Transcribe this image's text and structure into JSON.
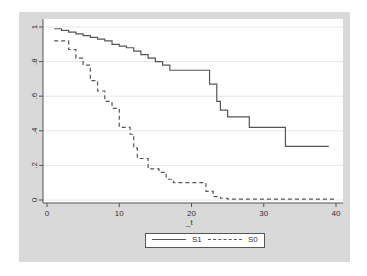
{
  "chart_data": {
    "type": "line",
    "subtype": "step (Kaplan-Meier survival curves)",
    "title": "",
    "xlabel": "_t",
    "ylabel": "",
    "xlim": [
      0,
      40
    ],
    "ylim": [
      0,
      1
    ],
    "x_ticks": [
      "0",
      "10",
      "20",
      "30",
      "40"
    ],
    "y_ticks": [
      "0",
      ".2",
      ".4",
      ".6",
      ".8",
      "1"
    ],
    "grid": "horizontal",
    "legend_position": "bottom",
    "series": [
      {
        "name": "S1",
        "style": "solid",
        "points": [
          [
            1,
            0.99
          ],
          [
            2,
            0.98
          ],
          [
            3,
            0.97
          ],
          [
            4,
            0.96
          ],
          [
            5,
            0.95
          ],
          [
            6,
            0.94
          ],
          [
            7,
            0.93
          ],
          [
            8,
            0.92
          ],
          [
            9,
            0.9
          ],
          [
            10,
            0.89
          ],
          [
            11,
            0.88
          ],
          [
            12,
            0.86
          ],
          [
            13,
            0.84
          ],
          [
            14,
            0.82
          ],
          [
            15,
            0.8
          ],
          [
            16,
            0.78
          ],
          [
            17,
            0.75
          ],
          [
            20,
            0.75
          ],
          [
            22.5,
            0.73
          ],
          [
            22.5,
            0.67
          ],
          [
            23,
            0.67
          ],
          [
            23.5,
            0.57
          ],
          [
            24,
            0.52
          ],
          [
            25,
            0.48
          ],
          [
            28,
            0.48
          ],
          [
            28,
            0.42
          ],
          [
            33,
            0.42
          ],
          [
            33,
            0.31
          ],
          [
            39,
            0.31
          ]
        ]
      },
      {
        "name": "S0",
        "style": "dashed",
        "points": [
          [
            1,
            0.92
          ],
          [
            2,
            0.92
          ],
          [
            3,
            0.87
          ],
          [
            4,
            0.82
          ],
          [
            5,
            0.78
          ],
          [
            6,
            0.69
          ],
          [
            7,
            0.63
          ],
          [
            8,
            0.57
          ],
          [
            9,
            0.53
          ],
          [
            10,
            0.42
          ],
          [
            11.5,
            0.38
          ],
          [
            12,
            0.3
          ],
          [
            12.5,
            0.24
          ],
          [
            14,
            0.18
          ],
          [
            15.5,
            0.16
          ],
          [
            16.5,
            0.12
          ],
          [
            17.5,
            0.1
          ],
          [
            22,
            0.1
          ],
          [
            22,
            0.05
          ],
          [
            23,
            0.02
          ],
          [
            24,
            0.01
          ],
          [
            25,
            0.005
          ],
          [
            40,
            0.005
          ]
        ]
      }
    ]
  },
  "legend": {
    "items": [
      {
        "label": "S1",
        "style": "solid"
      },
      {
        "label": "S0",
        "style": "dashed"
      }
    ]
  },
  "axes": {
    "x_label": "_t"
  },
  "colors": {
    "frame": "#d9d9d9",
    "plot_bg": "#ffffff",
    "line": "#555555",
    "grid": "#e6e6e6"
  }
}
